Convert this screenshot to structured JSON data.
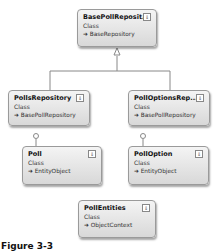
{
  "diagram": {
    "classes": [
      {
        "name": "BasePollReposit...",
        "kind": "Class",
        "base": "➜ BaseRepository"
      },
      {
        "name": "PollsRepository",
        "kind": "Class",
        "base": "➜ BasePollRepository"
      },
      {
        "name": "PollOptionsRep...",
        "kind": "Class",
        "base": "➜ BasePollRepository"
      },
      {
        "name": "Poll",
        "kind": "Class",
        "base": "➜ EntityObject"
      },
      {
        "name": "PollOption",
        "kind": "Class",
        "base": "➜ EntityObject"
      },
      {
        "name": "PollEntities",
        "kind": "Class",
        "base": "➜ ObjectContext"
      }
    ],
    "toggle_glyph": "⇓",
    "caption": "Figure 3-3"
  }
}
